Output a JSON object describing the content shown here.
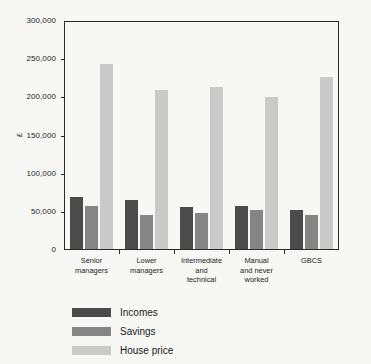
{
  "chart_data": {
    "type": "bar",
    "title": "",
    "subtitle": "",
    "xlabel": "",
    "ylabel": "£",
    "ylim": [
      0,
      300000
    ],
    "grid": false,
    "legend_position": "below-left",
    "categories": [
      "Senior\nmanagers",
      "Lower\nmanagers",
      "Intermediate\nand\ntechnical",
      "Manual\nand never\nworked",
      "GBCS"
    ],
    "y_ticks": [
      0,
      50000,
      100000,
      150000,
      200000,
      250000,
      300000
    ],
    "y_tick_labels": [
      "0",
      "50,000",
      "100,000",
      "150,000",
      "200,000",
      "250,000",
      "300,000"
    ],
    "series": [
      {
        "name": "Incomes",
        "color": "#4b4b4b",
        "values": [
          70000,
          65000,
          57000,
          58000,
          52000
        ]
      },
      {
        "name": "Savings",
        "color": "#858585",
        "values": [
          58000,
          46000,
          48000,
          52000,
          46000
        ]
      },
      {
        "name": "House price",
        "color": "#cacaca",
        "values": [
          244000,
          209000,
          213000,
          201000,
          227000
        ]
      }
    ]
  },
  "legend": {
    "items": [
      {
        "label": "Incomes",
        "color": "#4b4b4b"
      },
      {
        "label": "Savings",
        "color": "#858585"
      },
      {
        "label": "House price",
        "color": "#cacaca"
      }
    ]
  },
  "axis": {
    "y_label": "£"
  }
}
